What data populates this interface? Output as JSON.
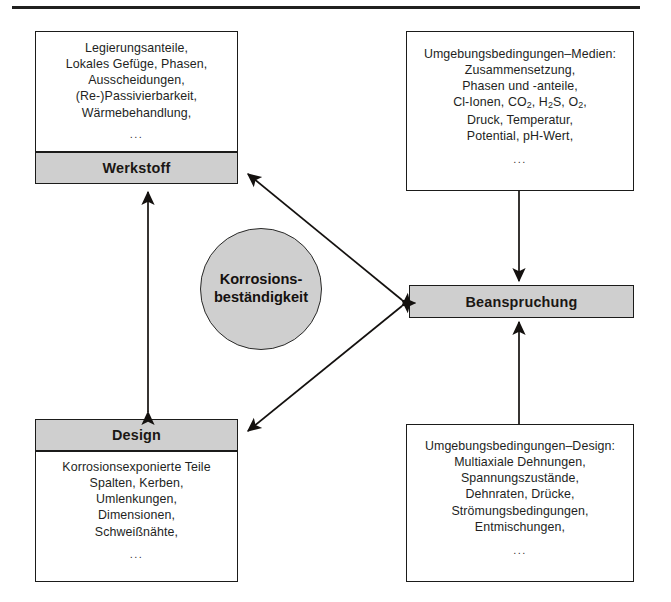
{
  "figure": {
    "title_rule": "top-horizontal-rule"
  },
  "center": {
    "label_line1": "Korrosions-",
    "label_line2": "beständigkeit",
    "fill": "#cfcfcf"
  },
  "nodes": {
    "werkstoff": {
      "label": "Werkstoff",
      "items": [
        "Legierungsanteile,",
        "Lokales Gefüge, Phasen,",
        "Ausscheidungen,",
        "(Re-)Passivierbarkeit,",
        "Wärmebehandlung,"
      ],
      "ellipsis": "..."
    },
    "design": {
      "label": "Design",
      "items": [
        "Korrosionsexponierte Teile",
        "Spalten, Kerben,",
        "Umlenkungen,",
        "Dimensionen,",
        "Schweißnähte,"
      ],
      "ellipsis": "..."
    },
    "beanspruchung": {
      "label": "Beanspruchung"
    },
    "medien": {
      "heading": "Umgebungsbedingungen–Medien:",
      "items": [
        "Zusammensetzung,",
        "Phasen und -anteile,",
        "Cl-Ionen, CO2, H2S, O2,",
        "Druck, Temperatur,",
        "Potential, pH-Wert,"
      ],
      "ellipsis": "..."
    },
    "umgebung_design": {
      "heading": "Umgebungsbedingungen–Design:",
      "items": [
        "Multiaxiale Dehnungen,",
        "Spannungszustände,",
        "Dehnraten, Drücke,",
        "Strömungsbedingungen,",
        "Entmischungen,"
      ],
      "ellipsis": "..."
    }
  },
  "connectors": [
    {
      "name": "werkstoff-design",
      "style": "double-headed-vertical"
    },
    {
      "name": "werkstoff-beanspruchung",
      "style": "double-headed-diagonal"
    },
    {
      "name": "design-beanspruchung",
      "style": "double-headed-diagonal"
    },
    {
      "name": "medien-beanspruchung",
      "style": "single-headed-down"
    },
    {
      "name": "umgebung-design-beanspruchung",
      "style": "single-headed-up"
    }
  ],
  "colors": {
    "ink": "#1b1b1a",
    "band_fill": "#cfcfcf",
    "page": "#ffffff"
  }
}
